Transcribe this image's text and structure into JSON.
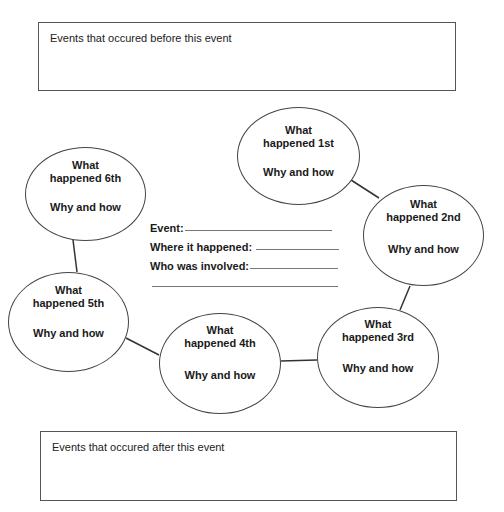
{
  "top_box": {
    "label": "Events that occured before this event"
  },
  "bottom_box": {
    "label": "Events that occured after this event"
  },
  "bubbles": [
    {
      "order": "1st",
      "what": "What happened 1st",
      "what_line1": "What",
      "what_line2": "happened 1st",
      "why": "Why and how"
    },
    {
      "order": "2nd",
      "what": "What happened 2nd",
      "what_line1": "What",
      "what_line2": "happened 2nd",
      "why": "Why and how"
    },
    {
      "order": "3rd",
      "what": "What happened 3rd",
      "what_line1": "What",
      "what_line2": "happened 3rd",
      "why": "Why and how"
    },
    {
      "order": "4th",
      "what": "What happened 4th",
      "what_line1": "What",
      "what_line2": "happened 4th",
      "why": "Why and how"
    },
    {
      "order": "5th",
      "what": "What happened 5th",
      "what_line1": "What",
      "what_line2": "happened 5th",
      "why": "Why and how"
    },
    {
      "order": "6th",
      "what": "What happened 6th",
      "what_line1": "What",
      "what_line2": "happened 6th",
      "why": "Why and how"
    }
  ],
  "center_fields": {
    "event_label": "Event:",
    "where_label": "Where it happened:",
    "who_label": "Who was involved:",
    "event_value": "",
    "where_value": "",
    "who_value": "",
    "extra_value": ""
  },
  "colors": {
    "line": "#444444",
    "box_border": "#555555",
    "text": "#1a1a1a"
  }
}
